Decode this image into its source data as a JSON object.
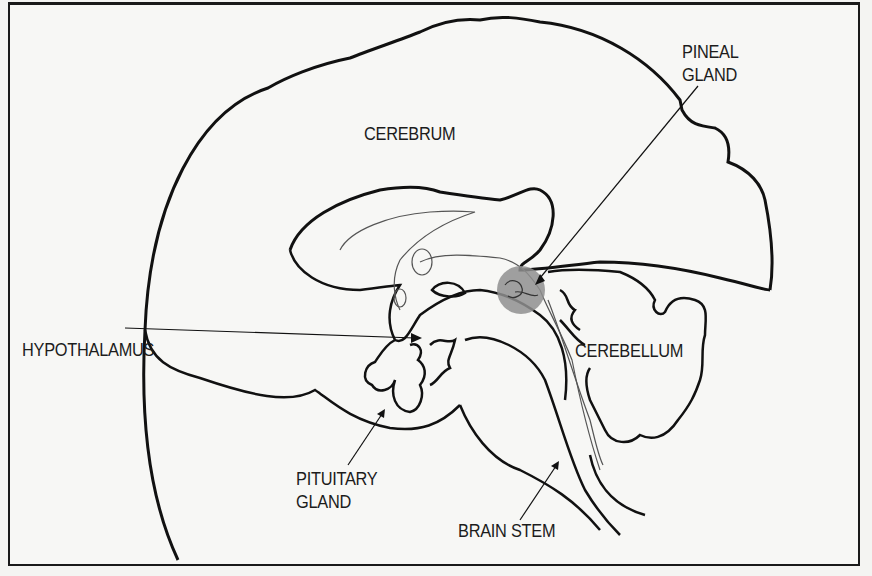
{
  "diagram": {
    "type": "anatomical-brain-sagittal-section",
    "colors": {
      "outline": "#111111",
      "thin_line": "#555555",
      "pineal_fill": "#8c8c8c",
      "background": "#f7f7f5"
    },
    "labels": {
      "cerebrum": {
        "text": "CEREBRUM"
      },
      "pineal_gland": {
        "line1": "PINEAL",
        "line2": "GLAND"
      },
      "hypothalamus": {
        "text": "HYPOTHALAMUS"
      },
      "cerebellum": {
        "text": "CEREBELLUM"
      },
      "pituitary_gland": {
        "line1": "PITUITARY",
        "line2": "GLAND"
      },
      "brain_stem": {
        "text": "BRAIN STEM"
      }
    }
  }
}
